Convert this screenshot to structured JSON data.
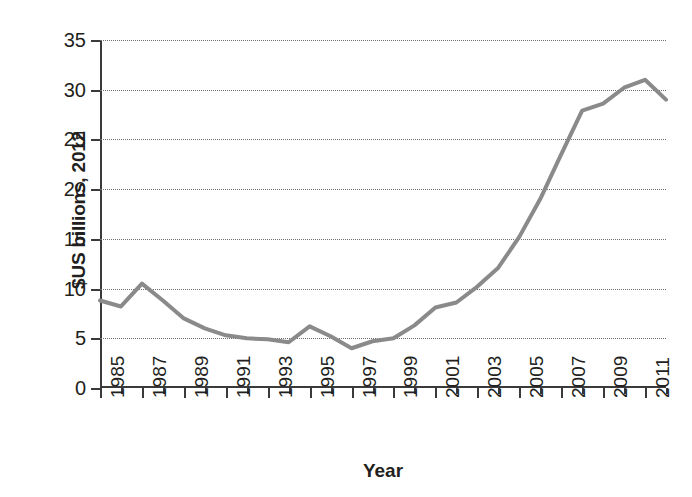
{
  "chart_data": {
    "type": "line",
    "title": "",
    "xlabel": "Year",
    "ylabel": "$US billions, 2012",
    "xlim": [
      1985,
      2012
    ],
    "ylim": [
      0,
      35
    ],
    "yticks": [
      0,
      5,
      10,
      15,
      20,
      25,
      30,
      35
    ],
    "ytick_labels": [
      "0",
      "5",
      "10",
      "15",
      "20",
      "25",
      "30",
      "35"
    ],
    "xticks": [
      1985,
      1987,
      1989,
      1991,
      1993,
      1995,
      1997,
      1999,
      2001,
      2003,
      2005,
      2007,
      2009,
      2011
    ],
    "xtick_labels": [
      "1985",
      "1987",
      "1989",
      "1991",
      "1993",
      "1995",
      "1997",
      "1999",
      "2001",
      "2003",
      "2005",
      "2007",
      "2009",
      "2011"
    ],
    "x": [
      1985,
      1986,
      1987,
      1988,
      1989,
      1990,
      1991,
      1992,
      1993,
      1994,
      1995,
      1996,
      1997,
      1998,
      1999,
      2000,
      2001,
      2002,
      2003,
      2004,
      2005,
      2006,
      2007,
      2008,
      2009,
      2010,
      2011,
      2012
    ],
    "categories": [
      "1985",
      "1986",
      "1987",
      "1988",
      "1989",
      "1990",
      "1991",
      "1992",
      "1993",
      "1994",
      "1995",
      "1996",
      "1997",
      "1998",
      "1999",
      "2000",
      "2001",
      "2002",
      "2003",
      "2004",
      "2005",
      "2006",
      "2007",
      "2008",
      "2009",
      "2010",
      "2011",
      "2012"
    ],
    "values": [
      8.8,
      8.2,
      10.5,
      8.8,
      7.0,
      6.0,
      5.3,
      5.0,
      4.9,
      4.6,
      6.2,
      5.2,
      4.0,
      4.7,
      5.0,
      6.3,
      8.1,
      8.6,
      10.2,
      12.1,
      15.2,
      19.0,
      23.5,
      27.9,
      28.6,
      30.2,
      31.0,
      29.0
    ],
    "series": [
      {
        "name": "$US billions, 2012",
        "color": "#8a8a8a",
        "line_width": 4,
        "values": [
          8.8,
          8.2,
          10.5,
          8.8,
          7.0,
          6.0,
          5.3,
          5.0,
          4.9,
          4.6,
          6.2,
          5.2,
          4.0,
          4.7,
          5.0,
          6.3,
          8.1,
          8.6,
          10.2,
          12.1,
          15.2,
          19.0,
          23.5,
          27.9,
          28.6,
          30.2,
          31.0,
          29.0
        ]
      }
    ],
    "grid": {
      "horizontal": true,
      "vertical": false,
      "style": "dotted",
      "color": "#6f6f6f"
    },
    "legend": {
      "visible": false,
      "position": "none"
    },
    "axis_color": "#3a3a3a",
    "background_color": "#ffffff",
    "text_color": "#231f20"
  }
}
